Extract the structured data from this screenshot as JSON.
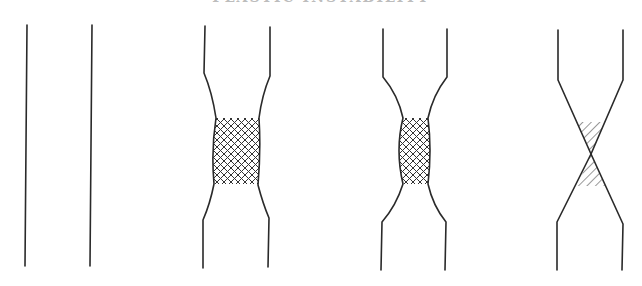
{
  "title_fragment": "PLASTIC INSTABILITY",
  "figure": {
    "panels": [
      {
        "id": "uniform",
        "label": ""
      },
      {
        "id": "diffuse-neck",
        "label": ""
      },
      {
        "id": "local-neck",
        "label": ""
      },
      {
        "id": "fracture",
        "label": ""
      }
    ],
    "colors": {
      "line": "#2a2a2a",
      "background": "#ffffff"
    }
  }
}
